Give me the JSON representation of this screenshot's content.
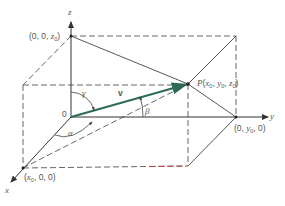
{
  "diagram": {
    "axes": {
      "x_label": "x",
      "y_label": "y",
      "z_label": "z"
    },
    "origin_label": "0",
    "points": {
      "P": {
        "name": "P",
        "coords": [
          "x",
          "y",
          "z"
        ],
        "subscript": "0"
      },
      "x_intercept": {
        "text_pre": "(",
        "var": "x",
        "sub": "0",
        "text_post": ", 0, 0)"
      },
      "y_intercept": {
        "text_pre": "(0, ",
        "var": "y",
        "sub": "0",
        "text_post": ", 0)"
      },
      "z_intercept": {
        "text_pre": "(0, 0, ",
        "var": "z",
        "sub": "0",
        "text_post": ")"
      }
    },
    "vector_label": "v",
    "angles": {
      "alpha": "α",
      "beta": "β",
      "gamma": "γ"
    },
    "colors": {
      "vector": "#2e6b57",
      "lines": "#444444",
      "text": "#555555",
      "accent_red": "#d04040"
    }
  }
}
